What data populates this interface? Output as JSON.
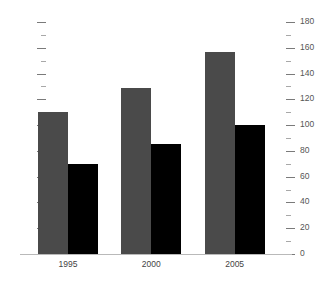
{
  "chart_data": {
    "type": "bar",
    "title": "",
    "subtitle": "",
    "xlabel": "",
    "ylabel": "",
    "categories": [
      "1995",
      "2000",
      "2005"
    ],
    "series": [
      {
        "name": "series-1",
        "color": "#4a4a4a",
        "values": [
          110,
          129,
          157
        ]
      },
      {
        "name": "series-2",
        "color": "#000000",
        "values": [
          70,
          85,
          100
        ]
      }
    ],
    "ylim": [
      0,
      180
    ],
    "y_major_step": 20,
    "y_minor_step": 10,
    "right_axis_ticks": [
      "0",
      "20",
      "40",
      "60",
      "80",
      "100",
      "120",
      "140",
      "160",
      "180"
    ],
    "left_axis_ticks": [
      "",
      "",
      "",
      "",
      "",
      "",
      "",
      "",
      "",
      ""
    ],
    "left_axis_labeled": false,
    "grid": false,
    "legend": "none",
    "background_color": "#ffffff",
    "axis_line_color": "#b9b9b9",
    "tick_color": "#888888",
    "label_color": "#555555"
  }
}
